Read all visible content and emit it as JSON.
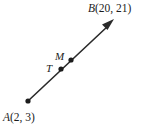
{
  "figure": {
    "type": "geometry-ray-diagram",
    "width": 151,
    "height": 131,
    "background_color": "#ffffff",
    "stroke_color": "#2a2a2a",
    "labels": {
      "point_a": {
        "letter": "A",
        "coords": "(2, 3)",
        "full": "A(2, 3)"
      },
      "point_b": {
        "letter": "B",
        "coords": "(20, 21)",
        "full": "B(20, 21)"
      },
      "point_m": {
        "letter": "M",
        "coords": "",
        "full": "M"
      },
      "point_t": {
        "letter": "T",
        "coords": "",
        "full": "T"
      }
    },
    "points": [
      {
        "name": "A",
        "x": 28,
        "y": 101
      },
      {
        "name": "T",
        "x": 61,
        "y": 69
      },
      {
        "name": "M",
        "x": 71,
        "y": 60
      }
    ],
    "ray": {
      "x1": 28,
      "y1": 101,
      "x2": 113,
      "y2": 21,
      "arrow_at": "B"
    }
  }
}
